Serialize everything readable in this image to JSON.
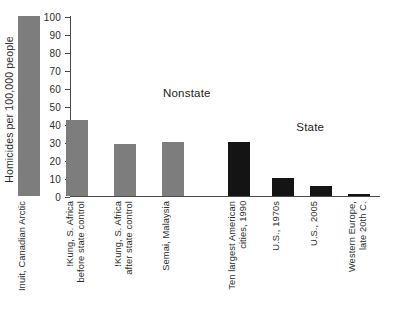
{
  "chart_data": {
    "type": "bar",
    "title": "",
    "subtitle": "",
    "xlabel": "",
    "ylabel": "Homicides per 100,000 people\nper year",
    "ylim": [
      0,
      100
    ],
    "ytick_labels": [
      "0",
      "10",
      "20",
      "30",
      "40",
      "50",
      "60",
      "70",
      "80",
      "90",
      "100"
    ],
    "ytick_values": [
      0,
      10,
      20,
      30,
      40,
      50,
      60,
      70,
      80,
      90,
      100
    ],
    "grid": false,
    "legend": "none",
    "categories": [
      "Inuit, Canadian Arctic",
      "!Kung, S. Africa\nbefore state control",
      "!Kung, S. Africa\nafter state control",
      "Semai, Malaysia",
      "Ten largest American\ncities, 1990",
      "U.S., 1970s",
      "U.S., 2005",
      "Western Europe,\nlate 20th C."
    ],
    "values": [
      100,
      42,
      29,
      30,
      30,
      10,
      5.5,
      1
    ],
    "groups": [
      "Nonstate",
      "Nonstate",
      "Nonstate",
      "Nonstate",
      "State",
      "State",
      "State",
      "State"
    ],
    "annotations": [
      {
        "text": "Nonstate",
        "x_frac": 0.3,
        "y_value": 61
      },
      {
        "text": "State",
        "x_frac": 0.73,
        "y_value": 42
      }
    ],
    "colors": {
      "nonstate_bar": "#7d7d7d",
      "state_bar": "#141414",
      "axis": "#4a4a4a",
      "text": "#2b2b2b",
      "background": "#ffffff"
    }
  }
}
